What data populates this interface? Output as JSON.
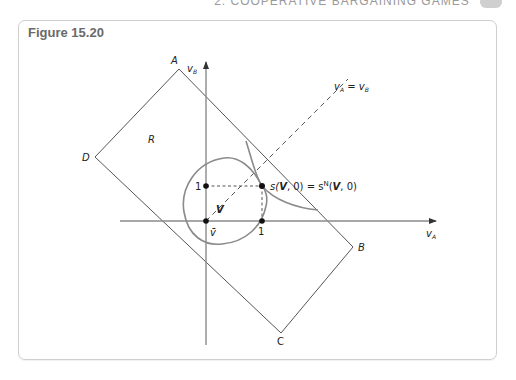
{
  "running_head": {
    "text": "2.  COOPERATIVE BARGAINING GAMES",
    "page_number": "..."
  },
  "figure": {
    "title": "Figure 15.20",
    "axes": {
      "x_label_main": "v",
      "x_label_sub": "A",
      "y_label_main": "v",
      "y_label_sub": "B"
    },
    "ticks": {
      "x_one": "1",
      "y_one": "1",
      "origin": "v̄"
    },
    "vertices": {
      "A": "A",
      "B": "B",
      "C": "C",
      "D": "D"
    },
    "regions": {
      "R": "R",
      "V": "V"
    },
    "diagonal_label": {
      "lhs_main": "v",
      "lhs_sub": "A",
      "eq": "=",
      "rhs_main": "v",
      "rhs_sub": "B"
    },
    "solution_label": {
      "left": "s(",
      "V1": "V",
      "mid1": ", 0) = s",
      "sup": "N",
      "mid2": "(",
      "V2": "V",
      "end": ", 0)"
    },
    "colors": {
      "line": "#555555",
      "curve": "#8a8a8a",
      "dashed": "#555555",
      "frame": "#cfcfcf",
      "title": "#6a6a6a"
    }
  }
}
